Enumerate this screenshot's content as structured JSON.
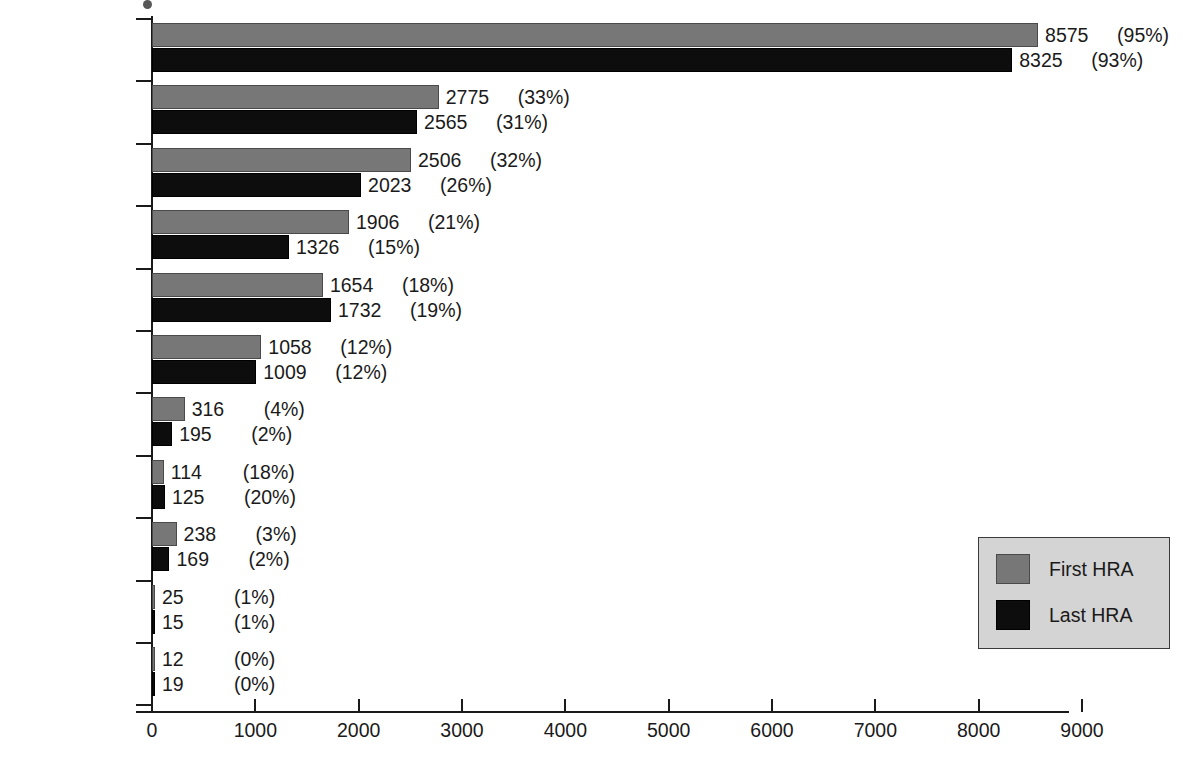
{
  "chart_data": {
    "type": "bar",
    "orientation": "horizontal",
    "title": "",
    "xlabel": "",
    "ylabel": "",
    "xlim": [
      0,
      9000
    ],
    "xticks": [
      0,
      1000,
      2000,
      3000,
      4000,
      5000,
      6000,
      7000,
      8000,
      9000
    ],
    "xtick_labels": [
      "0",
      "1000",
      "2000",
      "3000",
      "4000",
      "5000",
      "6000",
      "7000",
      "8000",
      "9000"
    ],
    "grid": false,
    "legend_position": "right",
    "categories": [
      "Fiber*",
      "Stress*",
      "Exercise*",
      "Seatbelt*",
      "BMI*",
      "Cigarettes*",
      "Fat*",
      "Cholesterol",
      "Salt*",
      "Diastolic BP*",
      "Alcohol"
    ],
    "series": [
      {
        "name": "First HRA",
        "color": "#777777",
        "values": [
          8575,
          2775,
          2506,
          1906,
          1654,
          1058,
          316,
          114,
          238,
          25,
          12
        ],
        "percent_labels": [
          "(95%)",
          "(33%)",
          "(32%)",
          "(21%)",
          "(18%)",
          "(12%)",
          "(4%)",
          "(18%)",
          "(3%)",
          "(1%)",
          "(0%)"
        ]
      },
      {
        "name": "Last HRA",
        "color": "#0d0d0d",
        "values": [
          8325,
          2565,
          2023,
          1326,
          1732,
          1009,
          195,
          125,
          169,
          15,
          19
        ],
        "percent_labels": [
          "(93%)",
          "(31%)",
          "(26%)",
          "(15%)",
          "(19%)",
          "(12%)",
          "(2%)",
          "(20%)",
          "(2%)",
          "(1%)",
          "(0%)"
        ]
      }
    ]
  },
  "legend": {
    "items": [
      {
        "label": "First HRA",
        "color": "#777777"
      },
      {
        "label": "Last HRA",
        "color": "#0d0d0d"
      }
    ]
  }
}
